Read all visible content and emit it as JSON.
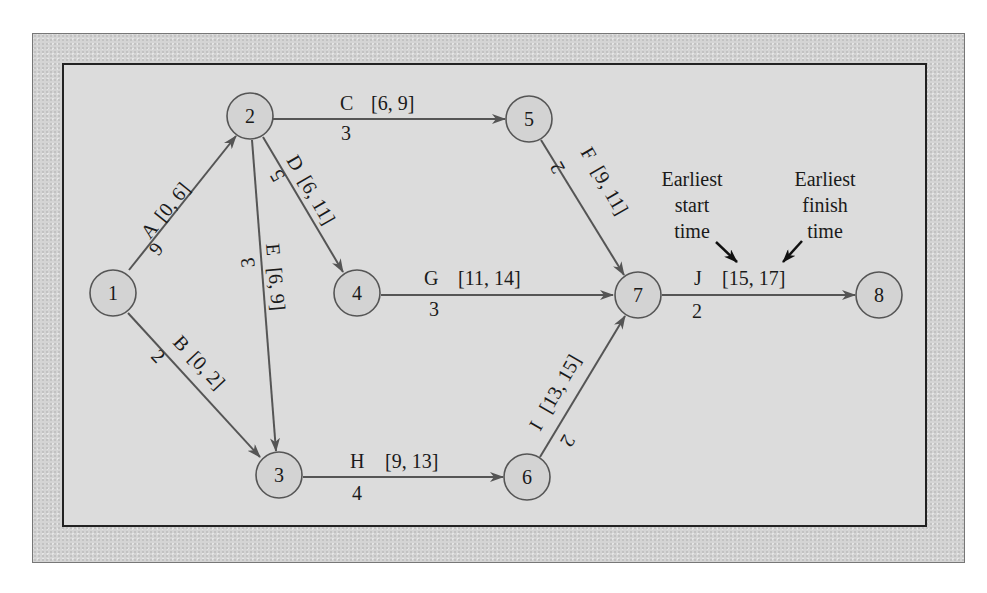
{
  "diagram": {
    "type": "project-network",
    "nodes": [
      {
        "id": "1",
        "label": "1",
        "x": 113,
        "y": 293
      },
      {
        "id": "2",
        "label": "2",
        "x": 250,
        "y": 116
      },
      {
        "id": "3",
        "label": "3",
        "x": 279,
        "y": 475
      },
      {
        "id": "4",
        "label": "4",
        "x": 357,
        "y": 293
      },
      {
        "id": "5",
        "label": "5",
        "x": 529,
        "y": 119
      },
      {
        "id": "6",
        "label": "6",
        "x": 527,
        "y": 477
      },
      {
        "id": "7",
        "label": "7",
        "x": 638,
        "y": 295
      },
      {
        "id": "8",
        "label": "8",
        "x": 879,
        "y": 295
      }
    ],
    "edges": [
      {
        "id": "A",
        "from": "1",
        "to": "2",
        "activity": "A",
        "interval": "[0, 6]",
        "duration": "6"
      },
      {
        "id": "B",
        "from": "1",
        "to": "3",
        "activity": "B",
        "interval": "[0, 2]",
        "duration": "2"
      },
      {
        "id": "C",
        "from": "2",
        "to": "5",
        "activity": "C",
        "interval": "[6, 9]",
        "duration": "3"
      },
      {
        "id": "D",
        "from": "2",
        "to": "4",
        "activity": "D",
        "interval": "[6, 11]",
        "duration": "5"
      },
      {
        "id": "E",
        "from": "2",
        "to": "3",
        "activity": "E",
        "interval": "[6, 9]",
        "duration": "3"
      },
      {
        "id": "F",
        "from": "5",
        "to": "7",
        "activity": "F",
        "interval": "[9, 11]",
        "duration": "2"
      },
      {
        "id": "G",
        "from": "4",
        "to": "7",
        "activity": "G",
        "interval": "[11, 14]",
        "duration": "3"
      },
      {
        "id": "H",
        "from": "3",
        "to": "6",
        "activity": "H",
        "interval": "[9, 13]",
        "duration": "4"
      },
      {
        "id": "I",
        "from": "6",
        "to": "7",
        "activity": "I",
        "interval": "[13, 15]",
        "duration": "2"
      },
      {
        "id": "J",
        "from": "7",
        "to": "8",
        "activity": "J",
        "interval": "[15, 17]",
        "duration": "2"
      }
    ],
    "annotations": {
      "earliest_start": [
        "Earliest",
        "start",
        "time"
      ],
      "earliest_finish": [
        "Earliest",
        "finish",
        "time"
      ]
    }
  }
}
